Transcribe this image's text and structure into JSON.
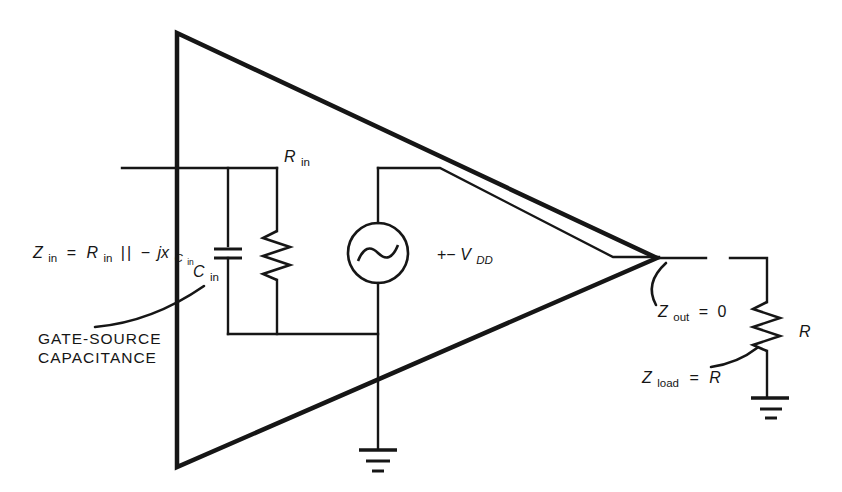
{
  "figure": {
    "kind": "circuit-diagram",
    "colors": {
      "ink": "#161616",
      "background": "#ffffff"
    }
  },
  "labels": {
    "z_in_formula": {
      "z": "Z",
      "z_sub": "in",
      "eq": "=",
      "r": "R",
      "r_sub": "in",
      "parallel": "||",
      "minus": "−",
      "jx": "jx",
      "jx_sub": "C",
      "jx_sub_sub": "in"
    },
    "caption": {
      "line1": "GATE-SOURCE",
      "line2": "CAPACITANCE"
    },
    "c_in": {
      "var": "C",
      "sub": "in"
    },
    "r_in": {
      "var": "R",
      "sub": "in"
    },
    "supply": {
      "sign": "+−",
      "var": "V",
      "sub": "DD"
    },
    "z_out": {
      "var": "Z",
      "sub": "out",
      "eq": "=",
      "value": "0"
    },
    "load_r": {
      "var": "R"
    },
    "z_load": {
      "var": "Z",
      "sub": "load",
      "eq": "=",
      "value": "R"
    }
  }
}
